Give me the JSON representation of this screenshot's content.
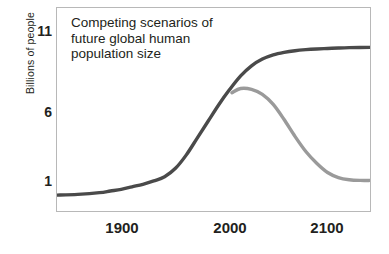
{
  "chart_data": {
    "type": "line",
    "title": "Competing scenarios of\nfuture global human\npopulation size",
    "xlabel": "",
    "ylabel": "Billions of people",
    "xlim": [
      1850,
      2140
    ],
    "ylim": [
      0.0,
      12.2
    ],
    "xticks": [
      1900,
      2000,
      2100
    ],
    "xtick_labels": [
      "1900",
      "2000",
      "2100"
    ],
    "yticks": [
      1,
      6,
      11
    ],
    "ytick_labels": [
      "1",
      "6",
      "11"
    ],
    "grid": false,
    "legend": "none",
    "frame": true,
    "series": [
      {
        "name": "high-growth scenario",
        "color": "#4a4a4a",
        "linewidth": 3.4,
        "x": [
          1850,
          1870,
          1890,
          1900,
          1910,
          1920,
          1930,
          1940,
          1950,
          1960,
          1970,
          1980,
          1990,
          2000,
          2010,
          2020,
          2030,
          2040,
          2050,
          2060,
          2070,
          2080,
          2090,
          2100,
          2110,
          2120,
          2140
        ],
        "values": [
          1.0,
          1.05,
          1.15,
          1.25,
          1.35,
          1.5,
          1.65,
          1.85,
          2.1,
          2.6,
          3.4,
          4.4,
          5.4,
          6.4,
          7.3,
          8.1,
          8.7,
          9.1,
          9.35,
          9.5,
          9.6,
          9.66,
          9.7,
          9.73,
          9.76,
          9.78,
          9.8
        ]
      },
      {
        "name": "decline scenario",
        "color": "#9a9a9a",
        "linewidth": 3.4,
        "x": [
          2012,
          2020,
          2030,
          2040,
          2050,
          2060,
          2070,
          2080,
          2090,
          2100,
          2110,
          2120,
          2130,
          2140
        ],
        "values": [
          7.1,
          7.35,
          7.3,
          7.0,
          6.4,
          5.5,
          4.5,
          3.6,
          2.9,
          2.35,
          2.05,
          1.92,
          1.88,
          1.88
        ]
      }
    ],
    "annotations": []
  },
  "colors": {
    "dark_series": "#4a4a4a",
    "light_series": "#9a9a9a",
    "frame": "#b8b8b8",
    "text": "#231f20",
    "background": "#ffffff"
  }
}
